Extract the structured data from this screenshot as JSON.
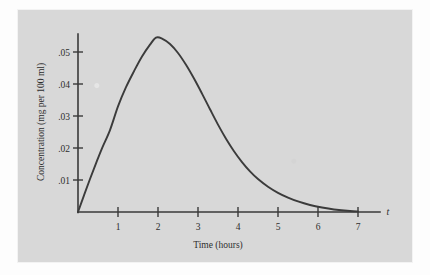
{
  "chart_data": {
    "type": "line",
    "title": "",
    "subtitle": "",
    "xlabel": "Time (hours)",
    "ylabel": "Concentration (mg per 100 ml)",
    "x_axis_variable": "t",
    "xlim": [
      0,
      7.55
    ],
    "ylim": [
      0,
      0.0625
    ],
    "grid": false,
    "legend": null,
    "annotations": [],
    "x_tick_labels": [
      "1",
      "2",
      "3",
      "4",
      "5",
      "6",
      "7"
    ],
    "x_ticks": [
      1,
      2,
      3,
      4,
      5,
      6,
      7
    ],
    "y_tick_labels": [
      ".01",
      ".02",
      ".03",
      ".04",
      ".05"
    ],
    "y_ticks": [
      0.01,
      0.02,
      0.03,
      0.04,
      0.05
    ],
    "series": [
      {
        "name": "drug concentration",
        "color": "#3b3b3b",
        "x": [
          0,
          0.15,
          0.3,
          0.45,
          0.6,
          0.8,
          1.0,
          1.2,
          1.4,
          1.6,
          1.8,
          1.95,
          2.1,
          2.3,
          2.5,
          2.7,
          2.9,
          3.1,
          3.3,
          3.5,
          3.7,
          3.9,
          4.1,
          4.3,
          4.5,
          4.75,
          5.0,
          5.25,
          5.5,
          5.8,
          6.1,
          6.4,
          6.8,
          7.0
        ],
        "y": [
          0.0,
          0.0052,
          0.0103,
          0.0152,
          0.0199,
          0.0256,
          0.033,
          0.039,
          0.044,
          0.0486,
          0.0523,
          0.0545,
          0.0542,
          0.0525,
          0.0497,
          0.046,
          0.0417,
          0.037,
          0.0321,
          0.0273,
          0.0229,
          0.019,
          0.0156,
          0.0127,
          0.0103,
          0.0079,
          0.006,
          0.0045,
          0.0033,
          0.0022,
          0.0014,
          0.0008,
          0.0003,
          0.0002
        ]
      }
    ],
    "colors": {
      "panel_background": "#d8d8d8",
      "page_background": "#fdfdfd",
      "axis": "#3a3a3a",
      "curve": "#3b3b3b",
      "text": "#2e2e2e"
    }
  }
}
